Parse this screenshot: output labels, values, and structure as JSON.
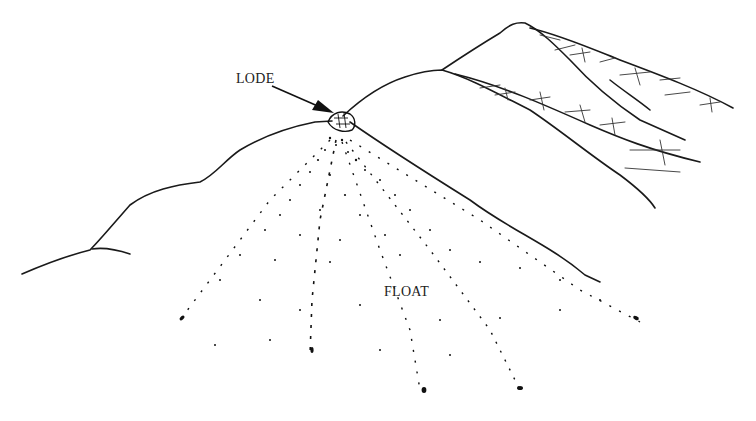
{
  "figure": {
    "labels": {
      "lode": "LODE",
      "float": "FLOAT"
    },
    "colors": {
      "line": "#1a1a1a",
      "background": "#ffffff"
    }
  }
}
